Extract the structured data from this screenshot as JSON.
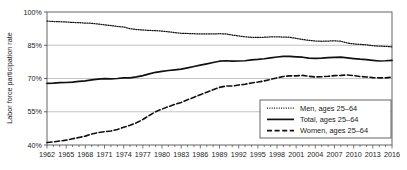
{
  "chart_data": {
    "type": "line",
    "title": "",
    "xlabel": "",
    "ylabel": "Labor force participation rate",
    "xlim": [
      1962,
      2016
    ],
    "ylim": [
      40,
      100
    ],
    "yticks": [
      "40%",
      "55%",
      "70%",
      "85%",
      "100%"
    ],
    "ytick_values": [
      40,
      55,
      70,
      85,
      100
    ],
    "grid": "horizontal",
    "legend_position": "bottom-right",
    "xticks": [
      "1962",
      "1965",
      "1968",
      "1971",
      "1974",
      "1977",
      "1980",
      "1983",
      "1986",
      "1989",
      "1992",
      "1995",
      "1998",
      "2001",
      "2004",
      "2007",
      "2010",
      "2013",
      "2016"
    ],
    "xtick_values": [
      1962,
      1965,
      1968,
      1971,
      1974,
      1977,
      1980,
      1983,
      1986,
      1989,
      1992,
      1995,
      1998,
      2001,
      2004,
      2007,
      2010,
      2013,
      2016
    ],
    "x": [
      1962,
      1963,
      1964,
      1965,
      1966,
      1967,
      1968,
      1969,
      1970,
      1971,
      1972,
      1973,
      1974,
      1975,
      1976,
      1977,
      1978,
      1979,
      1980,
      1981,
      1982,
      1983,
      1984,
      1985,
      1986,
      1987,
      1988,
      1989,
      1990,
      1991,
      1992,
      1993,
      1994,
      1995,
      1996,
      1997,
      1998,
      1999,
      2000,
      2001,
      2002,
      2003,
      2004,
      2005,
      2006,
      2007,
      2008,
      2009,
      2010,
      2011,
      2012,
      2013,
      2014,
      2015,
      2016
    ],
    "series": [
      {
        "name": "Men, ages 25–64",
        "style": "dotted",
        "color": "#111111",
        "values": [
          95.9,
          95.7,
          95.6,
          95.5,
          95.3,
          95.2,
          95.0,
          94.9,
          94.6,
          94.2,
          93.9,
          93.5,
          93.2,
          92.5,
          92.1,
          91.9,
          91.7,
          91.6,
          91.4,
          91.1,
          90.7,
          90.4,
          90.3,
          90.2,
          90.1,
          90.1,
          90.1,
          90.2,
          90.1,
          89.6,
          89.2,
          88.8,
          88.6,
          88.5,
          88.6,
          88.8,
          88.8,
          88.7,
          88.6,
          88.1,
          87.6,
          87.2,
          86.9,
          86.8,
          86.9,
          87.0,
          86.8,
          86.0,
          85.6,
          85.4,
          85.2,
          84.8,
          84.6,
          84.5,
          84.3
        ]
      },
      {
        "name": "Total, ages 25–64",
        "style": "solid",
        "color": "#111111",
        "values": [
          67.8,
          67.9,
          68.1,
          68.2,
          68.4,
          68.7,
          68.9,
          69.4,
          69.7,
          69.9,
          69.8,
          70.0,
          70.3,
          70.3,
          70.7,
          71.3,
          72.1,
          72.8,
          73.2,
          73.6,
          73.9,
          74.2,
          74.8,
          75.4,
          76.0,
          76.6,
          77.2,
          77.8,
          78.0,
          77.8,
          77.9,
          78.0,
          78.4,
          78.6,
          78.9,
          79.3,
          79.7,
          80.0,
          80.0,
          79.8,
          79.6,
          79.2,
          79.1,
          79.2,
          79.4,
          79.5,
          79.6,
          79.3,
          79.0,
          78.7,
          78.5,
          78.2,
          77.9,
          78.0,
          78.2
        ]
      },
      {
        "name": "Women, ages 25–64",
        "style": "dashed",
        "color": "#111111",
        "values": [
          41.1,
          41.4,
          41.8,
          42.2,
          42.8,
          43.4,
          44.0,
          45.0,
          45.6,
          46.0,
          46.3,
          47.0,
          48.0,
          48.9,
          50.0,
          51.5,
          53.3,
          55.0,
          56.2,
          57.3,
          58.3,
          59.2,
          60.4,
          61.5,
          62.7,
          63.8,
          64.9,
          66.0,
          66.6,
          66.6,
          67.1,
          67.4,
          68.0,
          68.4,
          68.9,
          69.6,
          70.3,
          70.9,
          71.2,
          71.2,
          71.4,
          71.0,
          70.7,
          70.8,
          71.0,
          71.3,
          71.4,
          71.6,
          71.3,
          70.9,
          70.7,
          70.4,
          70.3,
          70.3,
          70.6
        ]
      }
    ]
  },
  "legend": {
    "items": [
      {
        "label": "Men, ages 25–64",
        "style": "dotted"
      },
      {
        "label": "Total, ages 25–64",
        "style": "solid"
      },
      {
        "label": "Women, ages 25–64",
        "style": "dashed"
      }
    ]
  },
  "colors": {
    "line": "#111111",
    "grid": "#aaaaaa",
    "axis": "#555555",
    "background": "#ffffff"
  }
}
